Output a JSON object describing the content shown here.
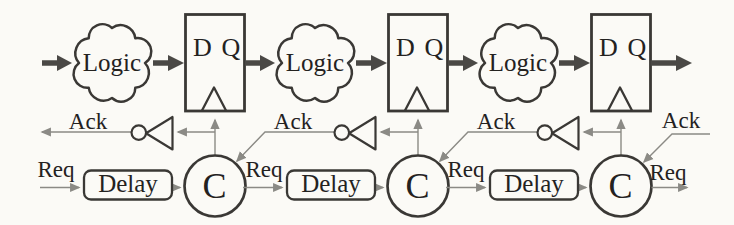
{
  "colors": {
    "paper": "#fbfaf6",
    "ink": "#24221f",
    "shape": "#3a3835",
    "wire": "#8b8a85",
    "thick": "#4a4845"
  },
  "stages": [
    {
      "logic": "Logic",
      "reg_d": "D",
      "reg_q": "Q",
      "ack": "Ack",
      "req": "Req",
      "delay": "Delay",
      "c_element": "C"
    },
    {
      "logic": "Logic",
      "reg_d": "D",
      "reg_q": "Q",
      "ack": "Ack",
      "req": "Req",
      "delay": "Delay",
      "c_element": "C"
    },
    {
      "logic": "Logic",
      "reg_d": "D",
      "reg_q": "Q",
      "ack": "Ack",
      "req": "Req",
      "delay": "Delay",
      "c_element": "C"
    }
  ],
  "right_side": {
    "ack_in": "Ack",
    "req_out": "Req"
  }
}
